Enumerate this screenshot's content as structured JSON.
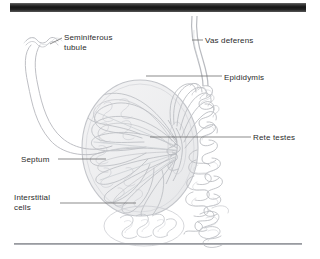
{
  "figure": {
    "background_color": "#ffffff",
    "line_color": "#b6b8bd",
    "label_color": "#2b2b2b",
    "top_bar_color": "#151515",
    "bottom_rule_color": "#9a9ca1"
  },
  "labels": {
    "seminiferous_tubule": "Seminiferous\ntubule",
    "vas_deferens": "Vas deferens",
    "epididymis": "Epididymis",
    "rete_testes": "Rete testes",
    "septum": "Septum",
    "interstitial_cells": "Interstitial\ncells"
  },
  "structures": [
    {
      "name": "seminiferous-tubule",
      "label": "Seminiferous tubule"
    },
    {
      "name": "vas-deferens",
      "label": "Vas deferens"
    },
    {
      "name": "epididymis",
      "label": "Epididymis"
    },
    {
      "name": "rete-testes",
      "label": "Rete testes"
    },
    {
      "name": "septum",
      "label": "Septum"
    },
    {
      "name": "interstitial-cells",
      "label": "Interstitial cells"
    },
    {
      "name": "testis-body",
      "label": "Testis"
    }
  ]
}
